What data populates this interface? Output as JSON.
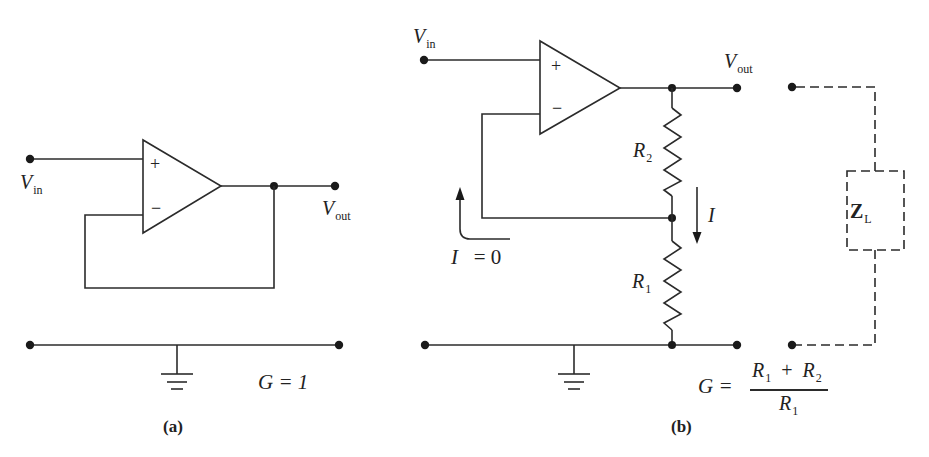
{
  "figure": {
    "panel_a": {
      "caption": "(a)",
      "input_label": "V",
      "input_sub": "in",
      "output_label": "V",
      "output_sub": "out",
      "plus_sign": "+",
      "minus_sign": "−",
      "gain_formula": "G  =  1"
    },
    "panel_b": {
      "caption": "(b)",
      "input_label": "V",
      "input_sub": "in",
      "output_label": "V",
      "output_sub": "out",
      "plus_sign": "+",
      "minus_sign": "−",
      "r2_label": "R",
      "r2_sub": "2",
      "r1_label": "R",
      "r1_sub": "1",
      "current_label": "I",
      "zero_current_label": "I",
      "zero_current_value": "=  0",
      "load_label": "Z",
      "load_sub": "L",
      "gain": {
        "lhs": "G  =",
        "numerator_a": "R",
        "numerator_a_sub": "1",
        "numerator_op": "+",
        "numerator_b": "R",
        "numerator_b_sub": "2",
        "denominator": "R",
        "denominator_sub": "1"
      }
    }
  }
}
